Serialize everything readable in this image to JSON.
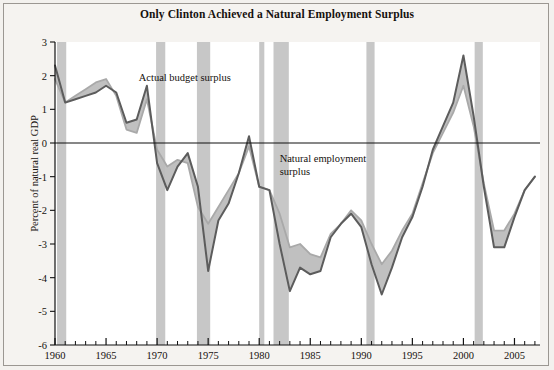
{
  "figure": {
    "title": "Only Clinton Achieved a Natural Employment Surplus",
    "background": "#f5f3f0",
    "border_color": "#9b9792"
  },
  "annotations": [
    {
      "name": "actual-budget-surplus-label",
      "text": "Actual budget surplus",
      "x": 1968.2,
      "y": 1.85
    },
    {
      "name": "natural-employment-surplus-label-line1",
      "text": "Natural employment",
      "x": 1982.0,
      "y": -0.55
    },
    {
      "name": "natural-employment-surplus-label-line2",
      "text": "surplus",
      "x": 1982.0,
      "y": -0.95
    }
  ],
  "chart_data": {
    "type": "line",
    "title": "Only Clinton Achieved a Natural Employment Surplus",
    "xlabel": "",
    "ylabel": "Percent of natural real GDP",
    "xlim": [
      1960,
      2007.5
    ],
    "ylim": [
      -6,
      3
    ],
    "grid": false,
    "legend": "annotations-inline",
    "y_ticks": [
      3,
      2,
      1,
      0,
      -1,
      -2,
      -3,
      -4,
      -5,
      -6
    ],
    "y_tick_labels": [
      "3",
      "2",
      "1",
      "0",
      "-1",
      "-2",
      "-3",
      "-4",
      "-5",
      "-6"
    ],
    "x_ticks": [
      1960,
      1965,
      1970,
      1975,
      1980,
      1985,
      1990,
      1995,
      2000,
      2005
    ],
    "x_tick_labels": [
      "1960",
      "1965",
      "1970",
      "1975",
      "1980",
      "1985",
      "1990",
      "1995",
      "2000",
      "2005"
    ],
    "x_minor_tick_interval": 1,
    "zero_line": 0,
    "x": [
      1960,
      1961,
      1962,
      1963,
      1964,
      1965,
      1966,
      1967,
      1968,
      1969,
      1970,
      1971,
      1972,
      1973,
      1974,
      1975,
      1976,
      1977,
      1978,
      1979,
      1980,
      1981,
      1982,
      1983,
      1984,
      1985,
      1986,
      1987,
      1988,
      1989,
      1990,
      1991,
      1992,
      1993,
      1994,
      1995,
      1996,
      1997,
      1998,
      1999,
      2000,
      2001,
      2002,
      2003,
      2004,
      2005,
      2006,
      2007
    ],
    "series": [
      {
        "name": "Actual budget surplus",
        "color": "#5c5c5c",
        "values": [
          2.3,
          1.2,
          1.3,
          1.4,
          1.5,
          1.7,
          1.5,
          0.6,
          0.7,
          1.7,
          -0.6,
          -1.4,
          -0.7,
          -0.3,
          -1.3,
          -3.8,
          -2.3,
          -1.8,
          -0.9,
          0.2,
          -1.3,
          -1.4,
          -3.0,
          -4.4,
          -3.7,
          -3.9,
          -3.8,
          -2.8,
          -2.4,
          -2.1,
          -2.5,
          -3.6,
          -4.5,
          -3.7,
          -2.8,
          -2.2,
          -1.3,
          -0.2,
          0.5,
          1.2,
          2.6,
          0.8,
          -1.3,
          -3.1,
          -3.1,
          -2.2,
          -1.4,
          -1.0
        ]
      },
      {
        "name": "Natural employment surplus",
        "color": "#a9a9a9",
        "values": [
          1.9,
          1.2,
          1.4,
          1.6,
          1.8,
          1.9,
          1.4,
          0.4,
          0.3,
          1.3,
          -0.2,
          -0.7,
          -0.5,
          -0.6,
          -1.9,
          -2.4,
          -1.9,
          -1.4,
          -0.9,
          -0.1,
          -1.3,
          -1.4,
          -2.1,
          -3.1,
          -3.0,
          -3.3,
          -3.4,
          -2.7,
          -2.4,
          -2.0,
          -2.3,
          -3.0,
          -3.6,
          -3.2,
          -2.6,
          -2.1,
          -1.2,
          -0.3,
          0.3,
          0.9,
          1.7,
          0.5,
          -1.2,
          -2.6,
          -2.6,
          -2.1,
          -1.4,
          -1.0
        ]
      }
    ],
    "band_fill_color": "#bdbdbd",
    "recession_bands": [
      {
        "name": "recession-1960",
        "start": 1960.2,
        "end": 1961.1
      },
      {
        "name": "recession-1970",
        "start": 1969.9,
        "end": 1970.8
      },
      {
        "name": "recession-1974",
        "start": 1973.9,
        "end": 1975.2
      },
      {
        "name": "recession-1980",
        "start": 1980.0,
        "end": 1980.5
      },
      {
        "name": "recession-1981",
        "start": 1981.4,
        "end": 1982.9
      },
      {
        "name": "recession-1990",
        "start": 1990.5,
        "end": 1991.3
      },
      {
        "name": "recession-2001",
        "start": 2001.1,
        "end": 2001.9
      }
    ],
    "recession_band_color": "#c7c7c7"
  }
}
